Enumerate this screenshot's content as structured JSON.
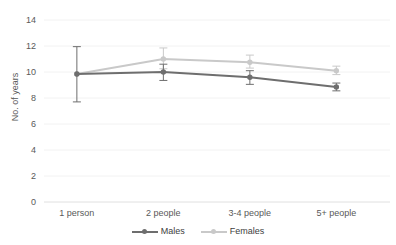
{
  "chart_data": {
    "type": "line",
    "title": "",
    "subtitle": "",
    "xlabel": "",
    "ylabel": "No. of years",
    "categories": [
      "1 person",
      "2 people",
      "3-4 people",
      "5+ people"
    ],
    "ylim": [
      0,
      14
    ],
    "y_ticks": [
      0,
      2,
      4,
      6,
      8,
      10,
      12,
      14
    ],
    "y_tick_labels": [
      "0",
      "2",
      "4",
      "6",
      "8",
      "10",
      "12",
      "14"
    ],
    "grid": true,
    "legend_position": "bottom",
    "error_bars": true,
    "series": [
      {
        "name": "Males",
        "color": "#6e6e6e",
        "marker": "circle",
        "values": [
          9.85,
          10.0,
          9.6,
          8.85
        ],
        "err_low": [
          2.15,
          0.65,
          0.55,
          0.3
        ],
        "err_high": [
          2.1,
          0.6,
          0.5,
          0.3
        ]
      },
      {
        "name": "Females",
        "color": "#c9c9c9",
        "marker": "circle",
        "values": [
          9.85,
          11.0,
          10.75,
          10.1
        ],
        "err_low": [
          0.0,
          0.75,
          0.45,
          0.3
        ],
        "err_high": [
          0.0,
          0.85,
          0.55,
          0.35
        ]
      }
    ]
  },
  "legend": {
    "items": [
      {
        "label": "Males",
        "color": "#6e6e6e"
      },
      {
        "label": "Females",
        "color": "#c9c9c9"
      }
    ]
  },
  "axes": {
    "y_title": "No. of years",
    "y_labels": [
      "14",
      "12",
      "10",
      "8",
      "6",
      "4",
      "2",
      "0"
    ],
    "x_labels": [
      "1 person",
      "2 people",
      "3-4 people",
      "5+ people"
    ]
  },
  "style": {
    "background": "#ffffff",
    "grid_color": "#f2f2f2",
    "axis_line_color": "#e6e6e6",
    "text_color": "#595959",
    "males_color": "#6e6e6e",
    "females_color": "#c9c9c9"
  }
}
